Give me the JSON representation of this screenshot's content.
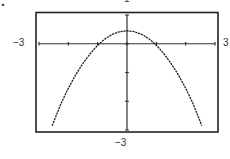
{
  "chart_data": {
    "type": "line",
    "title": "",
    "xlabel": "",
    "ylabel": "",
    "xlim": [
      -3,
      3
    ],
    "ylim": [
      -3,
      1
    ],
    "window_labels": {
      "top": "1",
      "left": "−3",
      "right": "3",
      "bottom": "−3"
    },
    "x_ticks": [
      -3,
      -2,
      -1,
      0,
      1,
      2,
      3
    ],
    "y_ticks": [
      -3,
      -2,
      -1,
      0,
      1
    ],
    "grid": false,
    "legend": null,
    "series": [
      {
        "name": "parabola",
        "x": [
          -2.55,
          -2.25,
          -2.0,
          -1.75,
          -1.5,
          -1.25,
          -1.0,
          -0.75,
          -0.5,
          -0.25,
          0.0,
          0.25,
          0.5,
          0.75,
          1.0,
          1.25,
          1.5,
          1.75,
          2.0,
          2.25,
          2.55
        ],
        "y": [
          -2.85,
          -2.08,
          -1.55,
          -1.08,
          -0.68,
          -0.34,
          -0.05,
          0.17,
          0.33,
          0.42,
          0.45,
          0.42,
          0.33,
          0.17,
          -0.05,
          -0.34,
          -0.68,
          -1.08,
          -1.55,
          -2.08,
          -2.85
        ]
      }
    ],
    "color": "#222222"
  },
  "labels": {
    "top": "1",
    "left": "−3",
    "right": "3",
    "bottom": "−3"
  },
  "marker": "."
}
